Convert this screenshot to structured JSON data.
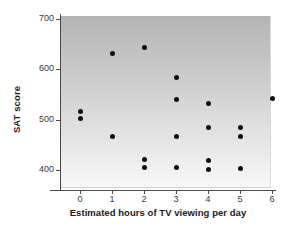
{
  "chart_data": {
    "type": "scatter",
    "title": "",
    "xlabel": "Estimated hours of TV viewing per day",
    "ylabel": "SAT score",
    "xlim": [
      -0.5,
      6.4
    ],
    "ylim": [
      370,
      700
    ],
    "xticks": [
      0,
      1,
      2,
      3,
      4,
      5,
      6
    ],
    "xtick_labels": [
      "0",
      "1",
      "2",
      "3",
      "4",
      "5",
      "6"
    ],
    "yticks": [
      400,
      500,
      600,
      700
    ],
    "ytick_labels": [
      "400",
      "500",
      "600",
      "700"
    ],
    "grid": false,
    "legend": null,
    "marker": "filled-circle",
    "marker_color": "#101010",
    "plot_background": "gray-vertical-gradient",
    "points": [
      {
        "x": 0,
        "y": 515
      },
      {
        "x": 0,
        "y": 501
      },
      {
        "x": 1,
        "y": 630
      },
      {
        "x": 1,
        "y": 466
      },
      {
        "x": 2,
        "y": 642
      },
      {
        "x": 2,
        "y": 421
      },
      {
        "x": 2,
        "y": 404
      },
      {
        "x": 3,
        "y": 583
      },
      {
        "x": 3,
        "y": 539
      },
      {
        "x": 3,
        "y": 466
      },
      {
        "x": 3,
        "y": 404
      },
      {
        "x": 4,
        "y": 532
      },
      {
        "x": 4,
        "y": 484
      },
      {
        "x": 4,
        "y": 418
      },
      {
        "x": 4,
        "y": 401
      },
      {
        "x": 5,
        "y": 484
      },
      {
        "x": 5,
        "y": 466
      },
      {
        "x": 5,
        "y": 402
      },
      {
        "x": 6,
        "y": 542
      }
    ]
  },
  "colors": {
    "marker": "#101010",
    "axis": "#4a4a4a",
    "text": "#1b1b1b",
    "tick_text": "#3a3a3a",
    "page_background": "#ffffff"
  }
}
